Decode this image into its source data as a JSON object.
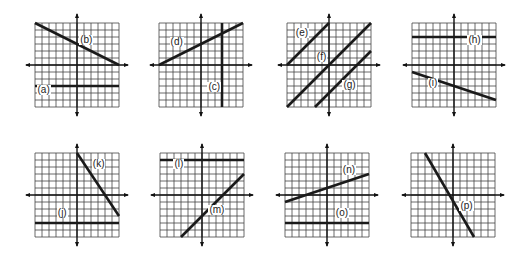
{
  "figure": {
    "grid_cells": 12,
    "line_color": "#1a1a1a",
    "grid_color": "#444444",
    "graphs": [
      {
        "id": "g1",
        "left": 22,
        "top": 10,
        "lines": [
          {
            "label": "(a)",
            "x1": -6,
            "y1": -3,
            "x2": 6,
            "y2": -3,
            "lx": -5.5,
            "ly": -3.6
          },
          {
            "label": "(b)",
            "x1": -6,
            "y1": 6,
            "x2": 6,
            "y2": 0,
            "lx": 0.6,
            "ly": 3.6
          }
        ]
      },
      {
        "id": "g2",
        "left": 146,
        "top": 10,
        "lines": [
          {
            "label": "(c)",
            "x1": 3,
            "y1": 6,
            "x2": 3,
            "y2": -6,
            "lx": 1.2,
            "ly": -3.2
          },
          {
            "label": "(d)",
            "x1": -6,
            "y1": 0,
            "x2": 6,
            "y2": 6,
            "lx": -4.2,
            "ly": 3.3
          }
        ]
      },
      {
        "id": "g3",
        "left": 274,
        "top": 10,
        "lines": [
          {
            "label": "(e)",
            "x1": -6,
            "y1": 0,
            "x2": 0,
            "y2": 6,
            "lx": -4.6,
            "ly": 4.6
          },
          {
            "label": "(f)",
            "x1": -6,
            "y1": -6,
            "x2": 6,
            "y2": 6,
            "lx": -1.6,
            "ly": 1.2
          },
          {
            "label": "(g)",
            "x1": -2,
            "y1": -6,
            "x2": 6,
            "y2": 2,
            "lx": 2.2,
            "ly": -2.8
          }
        ]
      },
      {
        "id": "g4",
        "left": 399,
        "top": 10,
        "lines": [
          {
            "label": "(h)",
            "x1": -6,
            "y1": 4,
            "x2": 6,
            "y2": 4,
            "lx": 2.2,
            "ly": 3.6
          },
          {
            "label": "(i)",
            "x1": -6,
            "y1": -1,
            "x2": 6,
            "y2": -5,
            "lx": -3.5,
            "ly": -2.6
          }
        ]
      },
      {
        "id": "g5",
        "left": 22,
        "top": 140,
        "lines": [
          {
            "label": "(j)",
            "x1": -6,
            "y1": -4,
            "x2": 6,
            "y2": -4,
            "lx": -2.6,
            "ly": -2.6
          },
          {
            "label": "(k)",
            "x1": 0,
            "y1": 6,
            "x2": 6,
            "y2": -3,
            "lx": 2.4,
            "ly": 4.4
          }
        ]
      },
      {
        "id": "g6",
        "left": 147,
        "top": 140,
        "lines": [
          {
            "label": "(l)",
            "x1": -6,
            "y1": 5,
            "x2": 6,
            "y2": 5,
            "lx": -3.8,
            "ly": 4.4
          },
          {
            "label": "(m)",
            "x1": -3,
            "y1": -6,
            "x2": 6,
            "y2": 3,
            "lx": 1.2,
            "ly": -2.2
          }
        ]
      },
      {
        "id": "g7",
        "left": 272,
        "top": 140,
        "lines": [
          {
            "label": "(n)",
            "x1": -6,
            "y1": -1,
            "x2": 6,
            "y2": 3,
            "lx": 2.4,
            "ly": 3.6
          },
          {
            "label": "(o)",
            "x1": -6,
            "y1": -4,
            "x2": 6,
            "y2": -4,
            "lx": 1.4,
            "ly": -2.6
          }
        ]
      },
      {
        "id": "g8",
        "left": 398,
        "top": 140,
        "lines": [
          {
            "label": "(p)",
            "x1": -4,
            "y1": 6,
            "x2": 3,
            "y2": -6,
            "lx": 1.2,
            "ly": -1.6
          }
        ]
      }
    ]
  }
}
